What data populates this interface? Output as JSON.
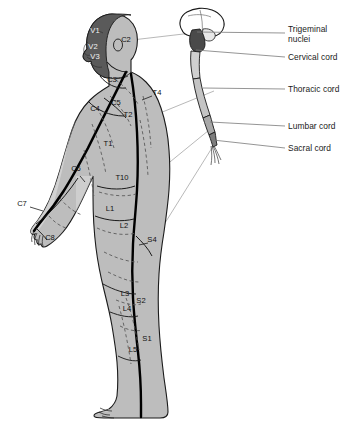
{
  "figure": {
    "background_color": "#ffffff",
    "skin_fill": "#b9b9b9",
    "skin_fill_light": "#d2d2d2",
    "scalp_fill": "#5a5a5a",
    "brainstem_fill": "#4a4a4a",
    "outline_color": "#1a1a1a",
    "dermatome_line_color": "#000000",
    "dashed_line_color": "#4d4d4d",
    "leader_line_color": "#8c8c8c"
  },
  "callouts": [
    {
      "id": "trigeminal",
      "label": "Trigeminal\nnuclei",
      "x": 288,
      "y": 24,
      "leader": {
        "x1": 285,
        "y1": 35,
        "x2": 197,
        "y2": 34
      }
    },
    {
      "id": "cervical",
      "label": "Cervical cord",
      "x": 288,
      "y": 53,
      "leader": {
        "x1": 285,
        "y1": 57,
        "x2": 196,
        "y2": 50
      }
    },
    {
      "id": "thoracic",
      "label": "Thoracic cord",
      "x": 288,
      "y": 85,
      "leader": {
        "x1": 285,
        "y1": 89,
        "x2": 203,
        "y2": 86
      }
    },
    {
      "id": "lumbar",
      "label": "Lumbar cord",
      "x": 288,
      "y": 122,
      "leader": {
        "x1": 285,
        "y1": 126,
        "x2": 210,
        "y2": 120
      }
    },
    {
      "id": "sacral",
      "label": "Sacral cord",
      "x": 288,
      "y": 144,
      "leader": {
        "x1": 285,
        "y1": 148,
        "x2": 213,
        "y2": 139
      }
    }
  ],
  "dermatomes": [
    {
      "id": "V1",
      "label": "V1",
      "x": 95,
      "y": 33,
      "anchor": "middle"
    },
    {
      "id": "V2",
      "label": "V2",
      "x": 93,
      "y": 49,
      "anchor": "middle"
    },
    {
      "id": "V3",
      "label": "V3",
      "x": 95,
      "y": 59,
      "anchor": "middle"
    },
    {
      "id": "C2",
      "label": "C2",
      "x": 126,
      "y": 42,
      "anchor": "middle"
    },
    {
      "id": "C3",
      "label": "C3",
      "x": 112,
      "y": 82,
      "anchor": "middle"
    },
    {
      "id": "C4",
      "label": "C4",
      "x": 95,
      "y": 111,
      "anchor": "middle"
    },
    {
      "id": "C5",
      "label": "C5",
      "x": 116,
      "y": 105,
      "anchor": "middle"
    },
    {
      "id": "C6",
      "label": "C6",
      "x": 76,
      "y": 171,
      "anchor": "middle"
    },
    {
      "id": "C7",
      "label": "C7",
      "x": 22,
      "y": 206,
      "anchor": "middle"
    },
    {
      "id": "C8",
      "label": "C8",
      "x": 50,
      "y": 240,
      "anchor": "middle"
    },
    {
      "id": "T1",
      "label": "T1",
      "x": 108,
      "y": 146,
      "anchor": "middle"
    },
    {
      "id": "T2",
      "label": "T2",
      "x": 128,
      "y": 117,
      "anchor": "middle"
    },
    {
      "id": "T4",
      "label": "T4",
      "x": 157,
      "y": 95,
      "anchor": "middle"
    },
    {
      "id": "T10",
      "label": "T10",
      "x": 122,
      "y": 180,
      "anchor": "middle"
    },
    {
      "id": "L1",
      "label": "L1",
      "x": 110,
      "y": 211,
      "anchor": "middle"
    },
    {
      "id": "L2",
      "label": "L2",
      "x": 124,
      "y": 228,
      "anchor": "middle"
    },
    {
      "id": "S4",
      "label": "S4",
      "x": 152,
      "y": 242,
      "anchor": "middle"
    },
    {
      "id": "L3",
      "label": "L3",
      "x": 125,
      "y": 296,
      "anchor": "middle"
    },
    {
      "id": "S2",
      "label": "S2",
      "x": 141,
      "y": 303,
      "anchor": "middle"
    },
    {
      "id": "L4",
      "label": "L4",
      "x": 127,
      "y": 311,
      "anchor": "middle"
    },
    {
      "id": "S1",
      "label": "S1",
      "x": 147,
      "y": 341,
      "anchor": "middle"
    },
    {
      "id": "L5",
      "label": "L5",
      "x": 133,
      "y": 352,
      "anchor": "middle"
    }
  ],
  "dermatome_leaders": [
    {
      "id": "C7-leader",
      "x1": 30,
      "y1": 206,
      "x2": 42,
      "y2": 210
    },
    {
      "id": "T4-leader",
      "x1": 152,
      "y1": 95,
      "x2": 141,
      "y2": 99
    },
    {
      "id": "S4-leader",
      "x1": 148,
      "y1": 242,
      "x2": 138,
      "y2": 244
    },
    {
      "id": "C6-leader",
      "x1": 80,
      "y1": 175,
      "x2": 84,
      "y2": 181
    }
  ],
  "long_leaders": [
    {
      "id": "t2-to-cord",
      "x1": 133,
      "y1": 124,
      "x2": 214,
      "y2": 91
    },
    {
      "id": "l1-to-cord",
      "x1": 116,
      "y1": 206,
      "x2": 214,
      "y2": 126
    },
    {
      "id": "s4-to-cord",
      "x1": 150,
      "y1": 247,
      "x2": 215,
      "y2": 143
    },
    {
      "id": "c2-to-cord",
      "x1": 132,
      "y1": 40,
      "x2": 192,
      "y2": 33
    }
  ]
}
